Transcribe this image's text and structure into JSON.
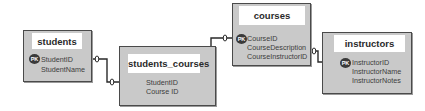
{
  "diagram": {
    "type": "entity-relationship",
    "colors": {
      "entity_fill": "#c9c9c9",
      "entity_border": "#4a4a4a",
      "title_fill": "#ffffff",
      "line": "#2a2a2a",
      "pk_badge": "#3a3a3a"
    },
    "entities": [
      {
        "name": "students",
        "fields": [
          {
            "label": "StudentID",
            "pk": true
          },
          {
            "label": "StudentName",
            "pk": false
          }
        ]
      },
      {
        "name": "students_courses",
        "fields": [
          {
            "label": "StudentID",
            "pk": false
          },
          {
            "label": "Course ID",
            "pk": false
          }
        ]
      },
      {
        "name": "courses",
        "fields": [
          {
            "label": "CourseID",
            "pk": true
          },
          {
            "label": "CourseDescription",
            "pk": false
          },
          {
            "label": "CourseInstructorID",
            "pk": false
          }
        ]
      },
      {
        "name": "instructors",
        "fields": [
          {
            "label": "InstructorID",
            "pk": true
          },
          {
            "label": "InstructorName",
            "pk": false
          },
          {
            "label": "InstructorNotes",
            "pk": false
          }
        ]
      }
    ],
    "pk_label": "PK",
    "relationships": [
      {
        "from": "students.StudentID",
        "to": "students_courses.StudentID",
        "cardinality_marker": "0"
      },
      {
        "from": "students_courses.Course ID",
        "to": "courses.CourseID",
        "cardinality_marker": "0"
      },
      {
        "from": "courses.CourseInstructorID",
        "to": "instructors.InstructorID",
        "cardinality_marker": "0"
      }
    ]
  }
}
